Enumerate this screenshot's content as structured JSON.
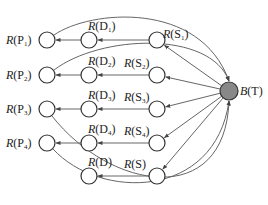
{
  "diagram": {
    "type": "directed-graph",
    "colors": {
      "stroke": "#333333",
      "edge": "#666666",
      "fill": "#ffffff",
      "target_fill": "#888888"
    },
    "target": {
      "id": "BT",
      "label_fn": "B",
      "label_arg": "T",
      "x": 229,
      "y": 91
    },
    "nodes": [
      {
        "id": "P1",
        "fn": "R",
        "arg": "P",
        "sub": "1",
        "x": 47,
        "y": 40
      },
      {
        "id": "P2",
        "fn": "R",
        "arg": "P",
        "sub": "2",
        "x": 47,
        "y": 75
      },
      {
        "id": "P3",
        "fn": "R",
        "arg": "P",
        "sub": "3",
        "x": 47,
        "y": 109
      },
      {
        "id": "P4",
        "fn": "R",
        "arg": "P",
        "sub": "4",
        "x": 47,
        "y": 143
      },
      {
        "id": "D1",
        "fn": "R",
        "arg": "D",
        "sub": "1",
        "x": 89,
        "y": 40
      },
      {
        "id": "D2",
        "fn": "R",
        "arg": "D",
        "sub": "2",
        "x": 89,
        "y": 75
      },
      {
        "id": "D3",
        "fn": "R",
        "arg": "D",
        "sub": "3",
        "x": 89,
        "y": 109
      },
      {
        "id": "D4",
        "fn": "R",
        "arg": "D",
        "sub": "4",
        "x": 89,
        "y": 143
      },
      {
        "id": "D",
        "fn": "R",
        "arg": "D",
        "sub": "",
        "x": 89,
        "y": 176
      },
      {
        "id": "S1",
        "fn": "R",
        "arg": "S",
        "sub": "1",
        "x": 157,
        "y": 40
      },
      {
        "id": "S2",
        "fn": "R",
        "arg": "S",
        "sub": "2",
        "x": 157,
        "y": 75
      },
      {
        "id": "S3",
        "fn": "R",
        "arg": "S",
        "sub": "3",
        "x": 157,
        "y": 109
      },
      {
        "id": "S4",
        "fn": "R",
        "arg": "S",
        "sub": "4",
        "x": 157,
        "y": 143
      },
      {
        "id": "S",
        "fn": "R",
        "arg": "S",
        "sub": "",
        "x": 157,
        "y": 176
      }
    ],
    "edges": [
      {
        "from": "BT",
        "to": "S1"
      },
      {
        "from": "BT",
        "to": "S2"
      },
      {
        "from": "BT",
        "to": "S3"
      },
      {
        "from": "BT",
        "to": "S4"
      },
      {
        "from": "BT",
        "to": "S"
      },
      {
        "from": "S1",
        "to": "D1"
      },
      {
        "from": "S2",
        "to": "D2"
      },
      {
        "from": "S3",
        "to": "D3"
      },
      {
        "from": "S4",
        "to": "D4"
      },
      {
        "from": "S",
        "to": "D"
      },
      {
        "from": "D1",
        "to": "P1"
      },
      {
        "from": "D2",
        "to": "P2"
      },
      {
        "from": "D3",
        "to": "P3"
      },
      {
        "from": "D4",
        "to": "P4"
      },
      {
        "from": "P1",
        "to": "BT",
        "curve": true
      },
      {
        "from": "P2",
        "to": "BT",
        "curve": true
      },
      {
        "from": "P3",
        "to": "BT",
        "curve": true
      },
      {
        "from": "P4",
        "to": "BT",
        "curve": true
      }
    ]
  }
}
